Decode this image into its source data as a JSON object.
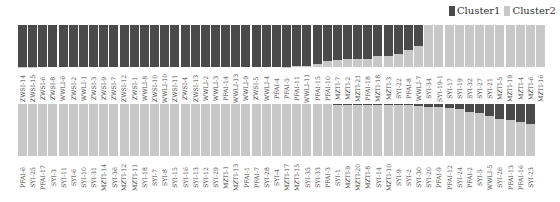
{
  "chart_data": {
    "type": "bar",
    "stacked": true,
    "normalized": true,
    "title": "",
    "xlabel": "",
    "ylabel": "",
    "ylim": [
      0,
      1
    ],
    "legend": {
      "position": "top-right",
      "entries": [
        "Cluster1",
        "Cluster2"
      ]
    },
    "colors": {
      "Cluster1": "#4a4a4a",
      "Cluster2": "#c8c8c8"
    },
    "panels": [
      {
        "name": "top-row",
        "categories": [
          "ZWSI-14",
          "ZWSI-15",
          "ZWSI-6",
          "ZWSI-8",
          "WWLI-6",
          "ZWSI-2",
          "WWLI-1",
          "ZWSI-3",
          "ZWSI-9",
          "ZWSI-7",
          "ZWSI-12",
          "ZWSI-1",
          "WWLI-8",
          "ZWSI-10",
          "WWLI-10",
          "ZWSI-11",
          "ZWSI-4",
          "ZWSI-13",
          "WWLI-2",
          "WWLI-3",
          "PFAI-14",
          "WWLI-13",
          "WWLI-9",
          "ZWSI-5",
          "WWLI-4",
          "PFAI-4",
          "PFAI-5",
          "PFAI-11",
          "WWLI-11",
          "PFAI-15",
          "PFAI-10",
          "MZTI-7",
          "MZTI-2",
          "MZTI-21",
          "PFAI-18",
          "MZTI-18",
          "MZTI-3",
          "SYI-22",
          "PFAI-8",
          "WWLI-7",
          "SYI-34",
          "SYI-19-1",
          "SYI-17",
          "SYI-19",
          "SYI-32",
          "SYI-27",
          "SYI-21",
          "MZTI-5",
          "MZTI-19",
          "MZTI-4",
          "MZTI-6",
          "MZTI-16"
        ],
        "series": [
          {
            "name": "Cluster1",
            "values": [
              0.99,
              0.99,
              1,
              1,
              1,
              1,
              1,
              1,
              1,
              1,
              1,
              1,
              1,
              1,
              1,
              1,
              1,
              1,
              1,
              1,
              1,
              1,
              1,
              1,
              1,
              1,
              0.99,
              0.98,
              0.97,
              0.92,
              0.85,
              0.83,
              0.82,
              0.82,
              0.82,
              0.74,
              0.74,
              0.7,
              0.6,
              0.5,
              0,
              0,
              0,
              0,
              0,
              0,
              0,
              0,
              0,
              0,
              0,
              0
            ]
          },
          {
            "name": "Cluster2",
            "values": [
              0.01,
              0.01,
              0,
              0,
              0,
              0,
              0,
              0,
              0,
              0,
              0,
              0,
              0,
              0,
              0,
              0,
              0,
              0,
              0,
              0,
              0,
              0,
              0,
              0,
              0,
              0,
              0.01,
              0.02,
              0.03,
              0.08,
              0.15,
              0.17,
              0.18,
              0.18,
              0.18,
              0.26,
              0.26,
              0.3,
              0.4,
              0.5,
              1,
              1,
              1,
              1,
              1,
              1,
              1,
              1,
              1,
              1,
              1,
              1
            ]
          }
        ]
      },
      {
        "name": "bottom-row",
        "categories": [
          "PFAI-6",
          "SYI-25",
          "PFAI-17",
          "SYI-3",
          "SYI-11",
          "SYI-6",
          "SYI-10",
          "SYI-31",
          "MZTI-14",
          "SYI-36",
          "MZTI-12",
          "MZTI-11",
          "SYI-18",
          "SYI-7",
          "SYI-8",
          "SYI-15",
          "SYI-16",
          "SYI-13",
          "SYI-12",
          "SYI-29",
          "MZTI-1",
          "MZTI-13",
          "PFAI-1",
          "PFAI-7",
          "SYI-28",
          "SYI-4",
          "MZTI-17",
          "MZTI-15",
          "SYI-35",
          "SYI-33",
          "PFAI-3",
          "SYI-1",
          "MZTI-9",
          "MZTI-20",
          "MZTI-8",
          "SYI-14",
          "MZTI-10",
          "SYI-9",
          "SYI-2",
          "SYI-30",
          "SYI-20",
          "PFAI-9",
          "PFAI-12",
          "SYI-24",
          "PFAI-2",
          "SYI-5",
          "WWLI-5",
          "SYI-26",
          "PFAI-13",
          "PFAI-16",
          "SYI-23"
        ],
        "series": [
          {
            "name": "Cluster1",
            "values": [
              0,
              0,
              0,
              0,
              0,
              0,
              0,
              0,
              0,
              0,
              0,
              0,
              0,
              0,
              0,
              0,
              0,
              0,
              0,
              0,
              0,
              0,
              0,
              0,
              0,
              0,
              0,
              0,
              0,
              0,
              0,
              0.01,
              0.01,
              0.01,
              0.01,
              0.01,
              0.01,
              0.01,
              0.01,
              0.03,
              0.05,
              0.06,
              0.08,
              0.1,
              0.15,
              0.18,
              0.23,
              0.28,
              0.3,
              0.34,
              0.38
            ]
          },
          {
            "name": "Cluster2",
            "values": [
              1,
              1,
              1,
              1,
              1,
              1,
              1,
              1,
              1,
              1,
              1,
              1,
              1,
              1,
              1,
              1,
              1,
              1,
              1,
              1,
              1,
              1,
              1,
              1,
              1,
              1,
              1,
              1,
              1,
              1,
              1,
              0.99,
              0.99,
              0.99,
              0.99,
              0.99,
              0.99,
              0.99,
              0.99,
              0.97,
              0.95,
              0.94,
              0.92,
              0.9,
              0.85,
              0.82,
              0.77,
              0.72,
              0.7,
              0.66,
              0.62
            ]
          }
        ]
      }
    ]
  },
  "legend": {
    "cluster1": "Cluster1",
    "cluster2": "Cluster2"
  }
}
